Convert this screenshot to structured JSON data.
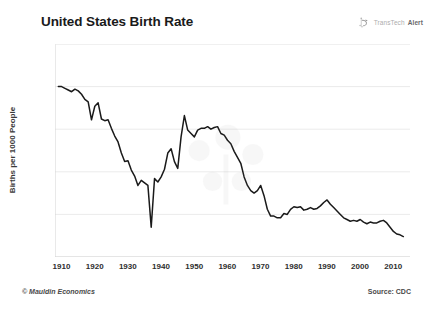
{
  "title": "United States Birth Rate",
  "brand": {
    "mark": "transtech-logo-icon",
    "name_light": "TransTech",
    "name_bold": "Alert"
  },
  "footer": {
    "copyright": "© Mauldin Economics",
    "source": "Source: CDC"
  },
  "colors": {
    "line": "#1a1a1a",
    "grid": "#ebebeb",
    "axis": "#d4d4d4",
    "text": "#2e2e2e",
    "background": "#ffffff"
  },
  "chart_data": {
    "type": "line",
    "title": "United States Birth Rate",
    "xlabel": "",
    "ylabel": "Births per 1000 People",
    "xlim": [
      1908,
      2015
    ],
    "ylim": [
      10,
      35
    ],
    "yticks": [
      10,
      15,
      20,
      25,
      30,
      35
    ],
    "xticks": [
      1910,
      1920,
      1930,
      1940,
      1950,
      1960,
      1970,
      1980,
      1990,
      2000,
      2010
    ],
    "grid": true,
    "legend": false,
    "source": "CDC",
    "series": [
      {
        "name": "US Birth Rate",
        "x": [
          1909,
          1910,
          1911,
          1912,
          1913,
          1914,
          1915,
          1916,
          1917,
          1918,
          1919,
          1920,
          1921,
          1922,
          1923,
          1924,
          1925,
          1926,
          1927,
          1928,
          1929,
          1930,
          1931,
          1932,
          1933,
          1934,
          1935,
          1936,
          1937,
          1938,
          1939,
          1940,
          1941,
          1942,
          1943,
          1944,
          1945,
          1946,
          1947,
          1948,
          1949,
          1950,
          1951,
          1952,
          1953,
          1954,
          1955,
          1956,
          1957,
          1958,
          1959,
          1960,
          1961,
          1962,
          1963,
          1964,
          1965,
          1966,
          1967,
          1968,
          1969,
          1970,
          1971,
          1972,
          1973,
          1974,
          1975,
          1976,
          1977,
          1978,
          1979,
          1980,
          1981,
          1982,
          1983,
          1984,
          1985,
          1986,
          1987,
          1988,
          1989,
          1990,
          1991,
          1992,
          1993,
          1994,
          1995,
          1996,
          1997,
          1998,
          1999,
          2000,
          2001,
          2002,
          2003,
          2004,
          2005,
          2006,
          2007,
          2008,
          2009,
          2010,
          2011,
          2012,
          2013
        ],
        "values": [
          30.0,
          30.0,
          29.8,
          29.6,
          29.4,
          29.7,
          29.5,
          29.1,
          28.5,
          28.2,
          26.1,
          27.7,
          28.1,
          26.2,
          26.0,
          26.1,
          25.1,
          24.2,
          23.5,
          22.2,
          21.2,
          21.3,
          20.2,
          19.5,
          18.4,
          19.0,
          18.7,
          18.4,
          13.5,
          19.2,
          18.8,
          19.4,
          20.3,
          22.2,
          22.7,
          21.2,
          20.4,
          24.1,
          26.6,
          24.9,
          24.5,
          24.1,
          24.9,
          25.1,
          25.1,
          25.3,
          25.0,
          25.2,
          25.3,
          24.5,
          24.3,
          23.7,
          23.3,
          22.4,
          21.7,
          21.0,
          19.4,
          18.4,
          17.8,
          17.5,
          17.8,
          18.4,
          17.2,
          15.6,
          14.8,
          14.8,
          14.6,
          14.6,
          15.1,
          15.0,
          15.6,
          15.9,
          15.8,
          15.9,
          15.5,
          15.6,
          15.8,
          15.6,
          15.7,
          16.0,
          16.4,
          16.7,
          16.2,
          15.8,
          15.4,
          15.0,
          14.6,
          14.4,
          14.2,
          14.3,
          14.2,
          14.4,
          14.1,
          13.9,
          14.1,
          14.0,
          14.0,
          14.2,
          14.3,
          14.0,
          13.5,
          13.0,
          12.7,
          12.6,
          12.4
        ]
      }
    ]
  }
}
